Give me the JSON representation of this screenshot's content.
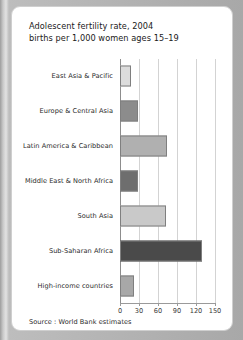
{
  "card": {
    "source_note": "Source : World Bank estimates"
  },
  "chart_data": {
    "type": "bar",
    "orientation": "horizontal",
    "title": "Adolescent fertility rate, 2004",
    "subtitle": "births per 1,000 women ages 15–19",
    "xlabel": "",
    "ylabel": "",
    "xlim": [
      0,
      150
    ],
    "xticks": [
      0,
      30,
      60,
      90,
      120,
      150
    ],
    "xtick_labels": [
      "0",
      "30",
      "60",
      "90",
      "120",
      "150"
    ],
    "grid": true,
    "legend": "none",
    "categories": [
      "East Asia & Pacific",
      "Europe & Central Asia",
      "Latin America & Caribbean",
      "Middle East & North Africa",
      "South Asia",
      "Sub-Saharan Africa",
      "High-income countries"
    ],
    "values": [
      18,
      28,
      74,
      28,
      73,
      130,
      22
    ],
    "bar_colors": [
      "#dcdcdc",
      "#8c8c8c",
      "#b0b0b0",
      "#6e6e6e",
      "#c9c9c9",
      "#4a4a4a",
      "#a8a8a8"
    ]
  }
}
